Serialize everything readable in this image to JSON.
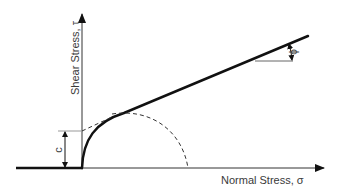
{
  "diagram": {
    "x_axis_label": "Normal Stress, σ",
    "y_axis_label": "Shear Stress, τ",
    "cohesion_label": "c",
    "friction_angle_label": "ϕ",
    "colors": {
      "line": "#111111",
      "axis": "#333333",
      "text": "#3a3a3a",
      "background": "#ffffff"
    }
  }
}
